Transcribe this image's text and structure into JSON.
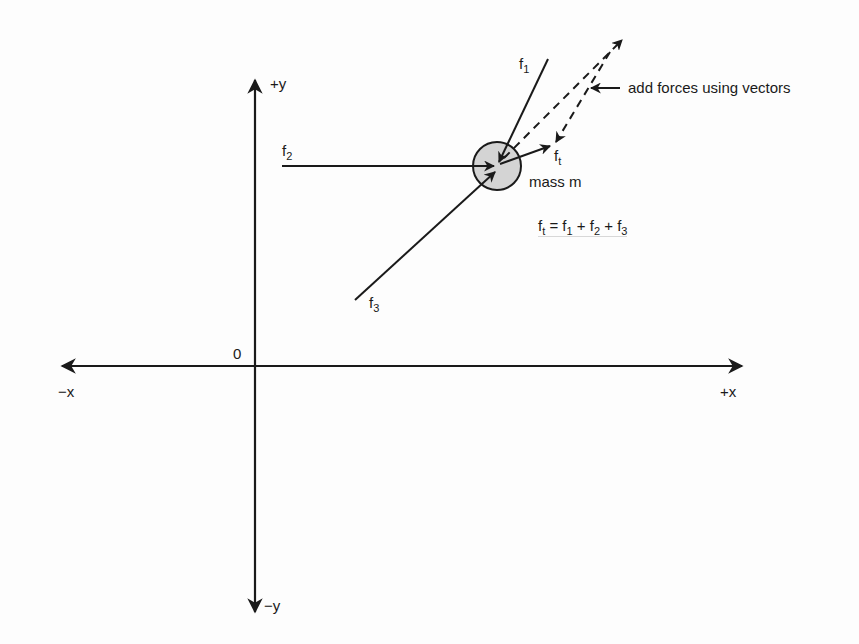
{
  "diagram": {
    "axes": {
      "x_pos_label": "+x",
      "x_neg_label": "−x",
      "y_pos_label": "+y",
      "y_neg_label": "−y",
      "origin_label": "0"
    },
    "mass": {
      "label": "mass m",
      "fill": "#d4d4d4"
    },
    "forces": [
      {
        "name": "f",
        "sub": "1"
      },
      {
        "name": "f",
        "sub": "2"
      },
      {
        "name": "f",
        "sub": "3"
      },
      {
        "name": "f",
        "sub": "t"
      }
    ],
    "annotation": "add forces using vectors",
    "equation": {
      "lhs": {
        "name": "f",
        "sub": "t"
      },
      "eq": " = ",
      "terms": [
        {
          "name": "f",
          "sub": "1"
        },
        {
          "name": "f",
          "sub": "2"
        },
        {
          "name": "f",
          "sub": "3"
        }
      ],
      "plus": " + "
    },
    "colors": {
      "stroke": "#1a1a1a",
      "mass_fill": "#d4d4d4",
      "background": "#fdfdfd"
    }
  }
}
